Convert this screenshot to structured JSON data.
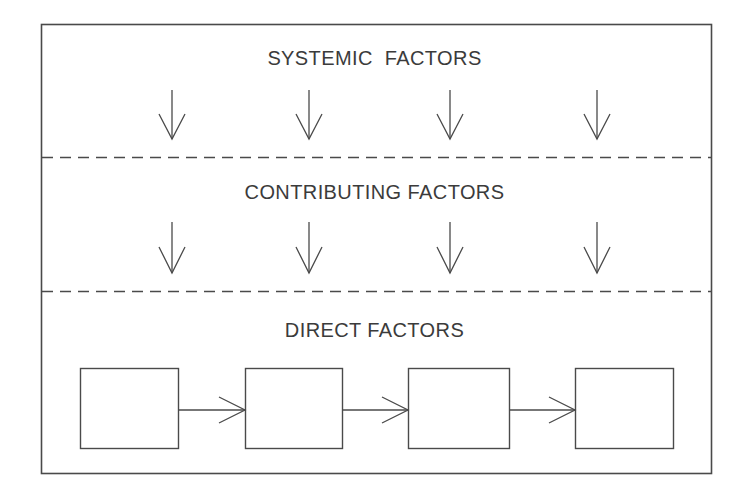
{
  "diagram": {
    "background_color": "#ffffff",
    "line_color": "#3b3b3b",
    "text_color": "#3b3b3b",
    "frame": {
      "x": 41,
      "y": 24,
      "width": 671,
      "height": 450
    },
    "sections": [
      {
        "id": "systemic",
        "label": "SYSTEMIC  FACTORS",
        "label_y": 48,
        "arrow_count": 4,
        "arrow_direction": "down",
        "arrows_x": [
          172,
          309,
          450,
          597
        ],
        "arrow_top": 90,
        "arrow_bottom": 139
      },
      {
        "id": "contributing",
        "label": "CONTRIBUTING FACTORS",
        "label_y": 182,
        "arrow_count": 4,
        "arrow_direction": "down",
        "arrows_x": [
          172,
          309,
          450,
          597
        ],
        "arrow_top": 222,
        "arrow_bottom": 273
      },
      {
        "id": "direct",
        "label": "DIRECT FACTORS",
        "label_y": 320,
        "arrow_count": 3,
        "arrow_direction": "right"
      }
    ],
    "dividers": [
      {
        "id": "divider-systemic-contributing",
        "y": 157,
        "style": "dashed",
        "x1": 42,
        "x2": 711
      },
      {
        "id": "divider-contributing-direct",
        "y": 291,
        "style": "dashed",
        "x1": 42,
        "x2": 711
      }
    ],
    "boxes": [
      {
        "id": "box-1",
        "label": "",
        "x": 80,
        "y": 368,
        "width": 98,
        "height": 80
      },
      {
        "id": "box-2",
        "label": "",
        "x": 245,
        "y": 368,
        "width": 97,
        "height": 80
      },
      {
        "id": "box-3",
        "label": "",
        "x": 408,
        "y": 368,
        "width": 101,
        "height": 80
      },
      {
        "id": "box-4",
        "label": "",
        "x": 575,
        "y": 368,
        "width": 98,
        "height": 80
      }
    ],
    "connectors": [
      {
        "id": "connector-1-2",
        "from": "box-1",
        "to": "box-2",
        "x1": 178,
        "x2": 245,
        "y": 410
      },
      {
        "id": "connector-2-3",
        "from": "box-2",
        "to": "box-3",
        "x1": 342,
        "x2": 408,
        "y": 410
      },
      {
        "id": "connector-3-4",
        "from": "box-3",
        "to": "box-4",
        "x1": 509,
        "x2": 575,
        "y": 410
      }
    ]
  }
}
